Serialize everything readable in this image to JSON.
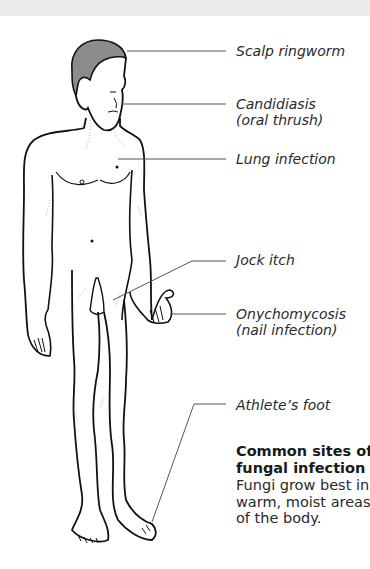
{
  "labels": {
    "scalp": "Scalp ringworm",
    "candidiasis_1": "Candidiasis",
    "candidiasis_2": "(oral thrush)",
    "lung": "Lung infection",
    "jock": "Jock itch",
    "onycho_1": "Onychomycosis",
    "onycho_2": "(nail infection)",
    "athlete": "Athlete’s foot"
  },
  "caption": {
    "title_line1": "Common sites of",
    "title_line2": "fungal infection",
    "body_line1": "Fungi grow best in",
    "body_line2": "warm, moist areas",
    "body_line3": "of the body."
  },
  "colors": {
    "outline": "#111111",
    "hair": "#8c8c8c",
    "leader": "#555555",
    "band": "#ebebeb"
  }
}
